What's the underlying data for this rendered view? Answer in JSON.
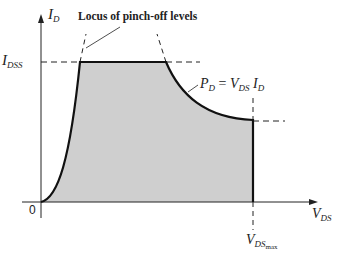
{
  "diagram": {
    "axes": {
      "y_label": {
        "main": "I",
        "sub": "D"
      },
      "x_label": {
        "main": "V",
        "sub": "DS"
      },
      "origin": "0"
    },
    "labels": {
      "idss": {
        "main": "I",
        "sub": "DSS"
      },
      "locus": "Locus of pinch-off levels",
      "power": {
        "p": "P",
        "p_sub": "D",
        "eq": "=",
        "v": "V",
        "v_sub": "DS",
        "i": "I",
        "i_sub": "D"
      },
      "vdsmax": {
        "main": "V",
        "sub": "DS",
        "subsub": "max"
      }
    },
    "colors": {
      "fill": "#cfcfcf",
      "line": "#111111",
      "axis": "#222222"
    }
  }
}
